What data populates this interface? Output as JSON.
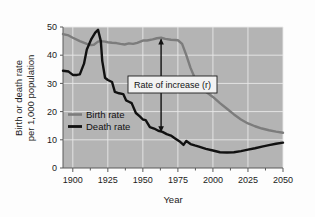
{
  "chart_data": {
    "type": "line",
    "title": "",
    "xlabel": "Year",
    "ylabel": "Birth or death rate per 1,000 population",
    "ylabel_line1": "Birth or death rate",
    "ylabel_line2": "per 1,000 population",
    "xlim": [
      1893,
      2050
    ],
    "ylim": [
      0,
      50
    ],
    "xticks": [
      1900,
      1925,
      1950,
      1975,
      2000,
      2025,
      2050
    ],
    "xtick_labels": [
      "1900",
      "1925",
      "1950",
      "1975",
      "2000",
      "2025",
      "2050"
    ],
    "yticks": [
      0,
      10,
      20,
      30,
      40,
      50
    ],
    "ytick_labels": [
      "0",
      "10",
      "20",
      "30",
      "40",
      "50"
    ],
    "minor_xtick_step": 12.5,
    "grid": true,
    "grid_color": "#e9e9e9",
    "plot_bg": "#b4b4b4",
    "legend_position": "center-left",
    "series": [
      {
        "name": "Birth rate",
        "color": "#7c7c7c",
        "width": 2.4,
        "x": [
          1893,
          1897,
          1900,
          1905,
          1910,
          1913,
          1915,
          1918,
          1920,
          1923,
          1925,
          1928,
          1931,
          1934,
          1937,
          1940,
          1943,
          1946,
          1950,
          1953,
          1957,
          1960,
          1963,
          1966,
          1970,
          1973,
          1975,
          1978,
          1981,
          1984,
          1987,
          1990,
          1995,
          2000,
          2005,
          2010,
          2015,
          2020,
          2025,
          2030,
          2035,
          2040,
          2045,
          2050
        ],
        "values": [
          47.5,
          47.0,
          46.2,
          45.0,
          44.0,
          43.6,
          43.7,
          44.8,
          45.0,
          44.8,
          44.6,
          44.4,
          44.3,
          44.0,
          43.8,
          44.2,
          44.0,
          44.4,
          45.2,
          45.2,
          45.6,
          46.0,
          46.2,
          45.8,
          45.5,
          45.4,
          45.3,
          44.0,
          40.0,
          35.5,
          32.0,
          30.0,
          27.0,
          25.2,
          23.0,
          21.0,
          19.0,
          17.2,
          15.8,
          14.8,
          14.0,
          13.4,
          12.9,
          12.5
        ]
      },
      {
        "name": "Death rate",
        "color": "#111111",
        "width": 2.4,
        "x": [
          1893,
          1897,
          1900,
          1903,
          1905,
          1908,
          1910,
          1913,
          1916,
          1918,
          1920,
          1921,
          1923,
          1925,
          1928,
          1930,
          1933,
          1936,
          1938,
          1940,
          1942,
          1945,
          1948,
          1950,
          1952,
          1955,
          1958,
          1961,
          1964,
          1967,
          1970,
          1973,
          1976,
          1979,
          1981,
          1984,
          1987,
          1990,
          1995,
          2000,
          2005,
          2010,
          2015,
          2020,
          2025,
          2030,
          2035,
          2040,
          2045,
          2050
        ],
        "values": [
          34.5,
          34.2,
          33.0,
          33.0,
          33.2,
          37.0,
          42.0,
          45.5,
          48.0,
          49.0,
          45.0,
          38.0,
          32.0,
          31.2,
          30.5,
          27.0,
          26.5,
          26.2,
          24.0,
          23.5,
          23.0,
          19.5,
          18.2,
          17.2,
          17.0,
          14.5,
          14.0,
          13.2,
          12.8,
          12.0,
          11.5,
          10.5,
          9.5,
          8.2,
          9.6,
          8.5,
          8.0,
          7.6,
          6.8,
          6.2,
          5.6,
          5.5,
          5.6,
          6.0,
          6.5,
          7.0,
          7.6,
          8.1,
          8.6,
          9.0
        ]
      }
    ],
    "annotation": {
      "text": "Rate  of increase (r)",
      "x_year": 1963,
      "y_top": 45.6,
      "y_bottom": 13.0,
      "arrow_color": "#111111"
    }
  },
  "legend": {
    "items": [
      {
        "label": "Birth rate",
        "color": "#7c7c7c"
      },
      {
        "label": "Death rate",
        "color": "#111111"
      }
    ]
  }
}
